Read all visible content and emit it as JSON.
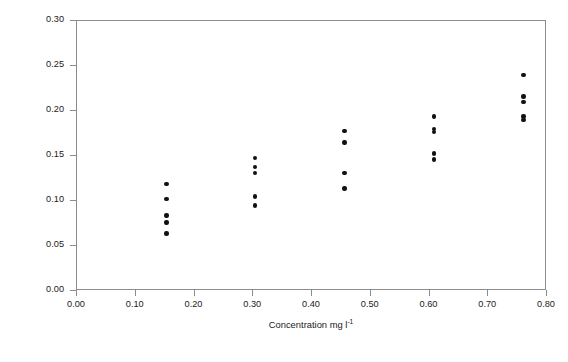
{
  "chart_data": {
    "type": "scatter",
    "title": "",
    "xlabel": "Concentration mg l",
    "xlabel_superscript": "-1",
    "ylabel": "Absorbance (AU)",
    "xlim": [
      0.0,
      0.8
    ],
    "ylim": [
      0.0,
      0.3
    ],
    "xticks": [
      "0.00",
      "0.10",
      "0.20",
      "0.30",
      "0.40",
      "0.50",
      "0.60",
      "0.70",
      "0.80"
    ],
    "xtick_values": [
      0.0,
      0.1,
      0.2,
      0.3,
      0.4,
      0.5,
      0.6,
      0.7,
      0.8
    ],
    "yticks": [
      "0.00",
      "0.05",
      "0.10",
      "0.15",
      "0.20",
      "0.25",
      "0.30"
    ],
    "ytick_values": [
      0.0,
      0.05,
      0.1,
      0.15,
      0.2,
      0.25,
      0.3
    ],
    "grid": false,
    "legend": false,
    "marker": "filled-circle",
    "marker_color": "#111111",
    "frame_color": "#8c8c8c",
    "points": [
      {
        "x": 0.152,
        "y": 0.119
      },
      {
        "x": 0.152,
        "y": 0.102
      },
      {
        "x": 0.152,
        "y": 0.084
      },
      {
        "x": 0.152,
        "y": 0.076
      },
      {
        "x": 0.152,
        "y": 0.064
      },
      {
        "x": 0.303,
        "y": 0.148
      },
      {
        "x": 0.303,
        "y": 0.138
      },
      {
        "x": 0.303,
        "y": 0.131
      },
      {
        "x": 0.303,
        "y": 0.105
      },
      {
        "x": 0.303,
        "y": 0.095
      },
      {
        "x": 0.455,
        "y": 0.178
      },
      {
        "x": 0.455,
        "y": 0.165
      },
      {
        "x": 0.455,
        "y": 0.131
      },
      {
        "x": 0.455,
        "y": 0.114
      },
      {
        "x": 0.608,
        "y": 0.194
      },
      {
        "x": 0.608,
        "y": 0.18
      },
      {
        "x": 0.608,
        "y": 0.177
      },
      {
        "x": 0.608,
        "y": 0.153
      },
      {
        "x": 0.608,
        "y": 0.146
      },
      {
        "x": 0.76,
        "y": 0.24
      },
      {
        "x": 0.76,
        "y": 0.216
      },
      {
        "x": 0.76,
        "y": 0.21
      },
      {
        "x": 0.76,
        "y": 0.194
      },
      {
        "x": 0.76,
        "y": 0.19
      }
    ]
  },
  "caption": ""
}
